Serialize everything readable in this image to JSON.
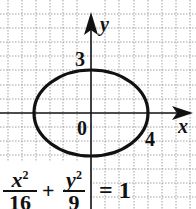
{
  "diagram": {
    "type": "ellipse-graph",
    "axes": {
      "x_label": "x",
      "y_label": "y",
      "origin_label": "0"
    },
    "ticks": {
      "y_intercept": "3",
      "x_intercept": "4"
    },
    "ellipse": {
      "semi_major_x": 4,
      "semi_minor_y": 3
    },
    "equation": {
      "term1_num": "x",
      "term1_exp": "2",
      "term1_den": "16",
      "plus": "+",
      "term2_num": "y",
      "term2_exp": "2",
      "term2_den": "9",
      "rhs": "= 1"
    },
    "colors": {
      "ink": "#111111",
      "grid": "#7a7a7a",
      "background": "#ffffff"
    }
  }
}
